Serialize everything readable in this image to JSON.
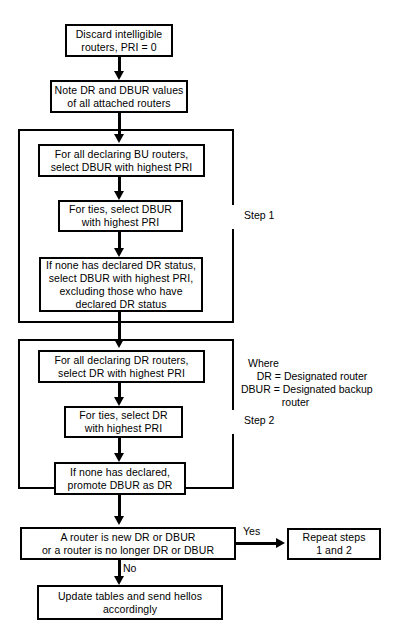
{
  "diagram": {
    "nodes": {
      "discard": "Discard intelligible\nrouters, PRI = 0",
      "note_values": "Note DR and DBUR values\nof all attached routers",
      "bu_select": "For all declaring BU routers,\nselect DBUR with highest PRI",
      "bu_ties": "For ties, select DBUR\nwith highest PRI",
      "bu_none": "If none has declared DR status,\nselect DBUR with highest PRI,\nexcluding those who have\ndeclared DR status",
      "dr_select": "For all declaring DR routers,\nselect DR with highest PRI",
      "dr_ties": "For ties, select DR\nwith highest PRI",
      "dr_none": "If none has declared,\npromote DBUR as DR",
      "decision": "A router is new DR or DBUR\nor a router is no longer DR or DBUR",
      "repeat": "Repeat steps\n1 and 2",
      "update": "Update tables and send hellos\naccordingly"
    },
    "group_labels": {
      "step1": "Step 1",
      "step2": "Step 2"
    },
    "edge_labels": {
      "yes": "Yes",
      "no": "No"
    },
    "legend": {
      "heading": "Where",
      "line_dr": "   DR = Designated router",
      "line_dbur": "DBUR = Designated backup",
      "line_cont": "              router"
    }
  }
}
